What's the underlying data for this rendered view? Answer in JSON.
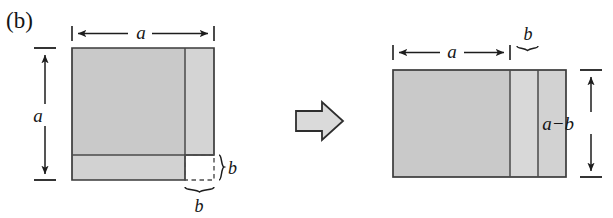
{
  "figure": {
    "panel_label": "(b)",
    "transform_arrow": "rightwards-block-arrow",
    "colors": {
      "fill_dark": "#c9c9c9",
      "fill_light": "#d7d7d7",
      "stroke": "#3b3b3b",
      "text": "#151515",
      "arrow_fill": "#d9d9d9",
      "background": "#ffffff"
    },
    "left_diagram": {
      "name": "stepped-square-before",
      "dimension_labels": {
        "top": "a",
        "left": "a",
        "right_brace": "b",
        "bottom_brace": "b"
      },
      "regions": [
        {
          "name": "main-square-body",
          "label": ""
        },
        {
          "name": "right-vertical-strip",
          "label": ""
        },
        {
          "name": "bottom-horizontal-strip",
          "label": ""
        },
        {
          "name": "missing-corner-square",
          "label": ""
        }
      ]
    },
    "right_diagram": {
      "name": "rearranged-rectangle-after",
      "dimension_labels": {
        "top_wide": "a",
        "top_narrow": "b",
        "right_vertical": "a−b"
      },
      "regions": [
        {
          "name": "wide-strip",
          "label": ""
        },
        {
          "name": "middle-strip",
          "label": ""
        },
        {
          "name": "narrow-strip",
          "label": ""
        }
      ]
    }
  }
}
